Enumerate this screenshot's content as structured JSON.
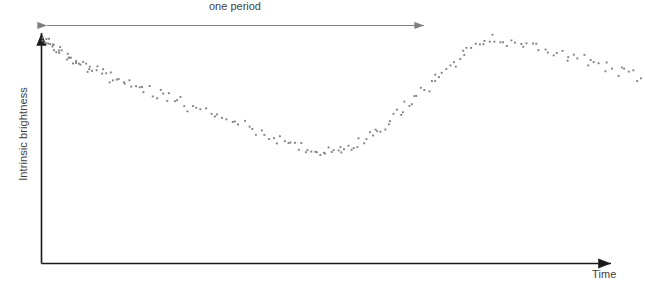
{
  "figure": {
    "title": "",
    "background": "#ffffff",
    "point_color": "#808080",
    "axis_color": "#1a1a1a",
    "annotation_color": "#7f7f7f"
  },
  "labels": {
    "y_axis": "Intrinsic brightness",
    "x_axis": "Time",
    "period_annotation": "one period"
  },
  "chart_data": {
    "type": "scatter",
    "title": "",
    "xlabel": "Time",
    "ylabel": "Intrinsic brightness",
    "xlim": [
      0,
      1.55
    ],
    "ylim": [
      0,
      1.1
    ],
    "grid": false,
    "legend": null,
    "annotations": [
      {
        "text": "one period",
        "type": "double-arrow",
        "x_start": 0.0,
        "x_end": 1.0,
        "y": 1.06
      }
    ],
    "period": 1.0,
    "series": [
      {
        "name": "observed brightness",
        "marker": "dot",
        "marker_size": 2,
        "color": "#808080",
        "x": [
          0.002,
          0.006,
          0.009,
          0.012,
          0.015,
          0.018,
          0.021,
          0.025,
          0.028,
          0.031,
          0.034,
          0.038,
          0.042,
          0.046,
          0.05,
          0.054,
          0.058,
          0.062,
          0.066,
          0.07,
          0.074,
          0.078,
          0.083,
          0.088,
          0.093,
          0.098,
          0.103,
          0.108,
          0.113,
          0.118,
          0.124,
          0.13,
          0.136,
          0.142,
          0.148,
          0.154,
          0.16,
          0.167,
          0.174,
          0.181,
          0.188,
          0.195,
          0.203,
          0.211,
          0.219,
          0.227,
          0.235,
          0.243,
          0.251,
          0.259,
          0.268,
          0.277,
          0.286,
          0.295,
          0.304,
          0.313,
          0.322,
          0.331,
          0.341,
          0.351,
          0.361,
          0.371,
          0.381,
          0.391,
          0.401,
          0.412,
          0.423,
          0.434,
          0.445,
          0.456,
          0.467,
          0.478,
          0.489,
          0.5,
          0.511,
          0.522,
          0.533,
          0.544,
          0.555,
          0.566,
          0.577,
          0.588,
          0.598,
          0.608,
          0.618,
          0.628,
          0.637,
          0.646,
          0.655,
          0.664,
          0.672,
          0.68,
          0.688,
          0.696,
          0.704,
          0.712,
          0.719,
          0.726,
          0.733,
          0.74,
          0.747,
          0.754,
          0.761,
          0.768,
          0.775,
          0.782,
          0.789,
          0.796,
          0.803,
          0.81,
          0.818,
          0.826,
          0.834,
          0.842,
          0.85,
          0.858,
          0.866,
          0.874,
          0.882,
          0.89,
          0.898,
          0.906,
          0.914,
          0.922,
          0.93,
          0.938,
          0.946,
          0.954,
          0.962,
          0.97,
          0.978,
          0.986,
          0.994,
          1.002,
          1.01,
          1.018,
          1.026,
          1.034,
          1.042,
          1.05,
          1.058,
          1.066,
          1.074,
          1.082,
          1.09,
          1.098,
          1.107,
          1.116,
          1.125,
          1.134,
          1.143,
          1.152,
          1.161,
          1.17,
          1.18,
          1.19,
          1.2,
          1.21,
          1.22,
          1.23,
          1.24,
          1.25,
          1.261,
          1.272,
          1.283,
          1.294,
          1.305,
          1.316,
          1.327,
          1.338,
          1.349,
          1.36,
          1.371,
          1.382,
          1.393,
          1.404,
          1.415,
          1.426,
          1.437,
          1.448,
          1.459,
          1.47,
          1.481,
          1.492,
          1.503,
          1.514,
          1.525,
          1.536,
          1.545,
          1.552
        ],
        "y": [
          1.0,
          0.996,
          0.988,
          0.994,
          0.978,
          0.985,
          0.971,
          0.976,
          0.962,
          0.968,
          0.955,
          0.963,
          0.947,
          0.952,
          0.938,
          0.944,
          0.931,
          0.922,
          0.936,
          0.915,
          0.908,
          0.917,
          0.901,
          0.893,
          0.905,
          0.886,
          0.878,
          0.889,
          0.871,
          0.864,
          0.875,
          0.856,
          0.848,
          0.858,
          0.841,
          0.833,
          0.843,
          0.826,
          0.818,
          0.828,
          0.811,
          0.803,
          0.813,
          0.796,
          0.788,
          0.798,
          0.781,
          0.773,
          0.783,
          0.766,
          0.757,
          0.767,
          0.748,
          0.739,
          0.749,
          0.73,
          0.721,
          0.731,
          0.712,
          0.702,
          0.712,
          0.693,
          0.683,
          0.693,
          0.673,
          0.662,
          0.672,
          0.651,
          0.641,
          0.65,
          0.629,
          0.618,
          0.627,
          0.606,
          0.595,
          0.604,
          0.583,
          0.572,
          0.58,
          0.56,
          0.549,
          0.557,
          0.538,
          0.528,
          0.536,
          0.519,
          0.51,
          0.518,
          0.503,
          0.496,
          0.503,
          0.491,
          0.486,
          0.492,
          0.483,
          0.48,
          0.484,
          0.479,
          0.478,
          0.482,
          0.48,
          0.482,
          0.479,
          0.485,
          0.489,
          0.486,
          0.495,
          0.503,
          0.498,
          0.512,
          0.524,
          0.518,
          0.537,
          0.552,
          0.545,
          0.567,
          0.584,
          0.576,
          0.6,
          0.619,
          0.61,
          0.636,
          0.656,
          0.647,
          0.674,
          0.695,
          0.686,
          0.714,
          0.735,
          0.726,
          0.755,
          0.776,
          0.767,
          0.796,
          0.817,
          0.808,
          0.837,
          0.857,
          0.848,
          0.877,
          0.896,
          0.888,
          0.915,
          0.932,
          0.925,
          0.949,
          0.963,
          0.957,
          0.976,
          0.986,
          0.981,
          0.995,
          1.0,
          0.997,
          0.992,
          0.996,
          0.984,
          0.989,
          0.975,
          0.98,
          0.966,
          0.971,
          0.957,
          0.963,
          0.948,
          0.954,
          0.939,
          0.93,
          0.944,
          0.922,
          0.914,
          0.924,
          0.906,
          0.898,
          0.908,
          0.89,
          0.881,
          0.891,
          0.873,
          0.865,
          0.875,
          0.857,
          0.848,
          0.858,
          0.84,
          0.832,
          0.842,
          0.823,
          0.812,
          0.805
        ]
      }
    ]
  }
}
